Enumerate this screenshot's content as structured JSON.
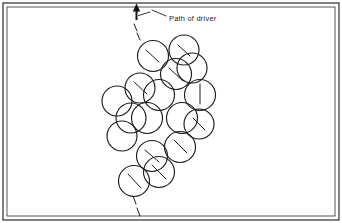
{
  "figure": {
    "kind": "technical-line-drawing",
    "background_color": "#ffffff",
    "ink_color": "#1c1c1c",
    "frame": {
      "outer": {
        "x": 3,
        "y": 3,
        "width": 336,
        "height": 217
      },
      "inner": {
        "x": 7,
        "y": 7,
        "width": 328,
        "height": 209
      }
    },
    "annotation": {
      "label": "Path of driver",
      "label_x": 169,
      "label_y": 21,
      "leader_points": "166,16 152,10",
      "arrow": {
        "shaft_x": 136.5,
        "shaft_top_y": 6.5,
        "shaft_bottom_y": 20.0,
        "head_points": "136.5,3.5 132.8,11.5 140.2,11.5",
        "barb_points": "150,12 138.5,15.5"
      }
    },
    "driver_path": {
      "description": "dashed centreline showing the swing path of the driver through the ball cluster",
      "entry_segments": [
        "134,24 137,31",
        "137,33 140,40"
      ],
      "exit_segments": [
        "133,196 136,204",
        "137,208 140,216"
      ]
    },
    "balls": [
      {
        "cx": 153,
        "cy": 56,
        "r": 15.5,
        "tick": "146,50 159,62"
      },
      {
        "cx": 184,
        "cy": 50,
        "r": 15.0,
        "tick": "178,45 190,56"
      },
      {
        "cx": 176,
        "cy": 74,
        "r": 15.5,
        "tick": "169,68 183,81"
      },
      {
        "cx": 140,
        "cy": 88,
        "r": 15.0,
        "tick": "134,82 147,94"
      },
      {
        "cx": 117,
        "cy": 101,
        "r": 15.0,
        "tick": ""
      },
      {
        "cx": 159,
        "cy": 95,
        "r": 15.5,
        "tick": ""
      },
      {
        "cx": 200,
        "cy": 95,
        "r": 15.5,
        "tick": "200,84 200,104"
      },
      {
        "cx": 147,
        "cy": 118,
        "r": 15.5,
        "tick": ""
      },
      {
        "cx": 182,
        "cy": 118,
        "r": 15.5,
        "tick": ""
      },
      {
        "cx": 199,
        "cy": 124,
        "r": 15.0,
        "tick": "193,118 205,130"
      },
      {
        "cx": 122,
        "cy": 136,
        "r": 15.0,
        "tick": ""
      },
      {
        "cx": 180,
        "cy": 147,
        "r": 15.5,
        "tick": "174,140 187,153"
      },
      {
        "cx": 152,
        "cy": 156,
        "r": 15.5,
        "tick": "145,150 159,162"
      },
      {
        "cx": 159,
        "cy": 172,
        "r": 15.5,
        "tick": "152,165 166,179"
      },
      {
        "cx": 134,
        "cy": 181,
        "r": 15.5,
        "tick": "128,174 141,188"
      },
      {
        "cx": 192,
        "cy": 68,
        "r": 15.0,
        "tick": ""
      },
      {
        "cx": 131,
        "cy": 118,
        "r": 15.0,
        "tick": ""
      }
    ]
  }
}
